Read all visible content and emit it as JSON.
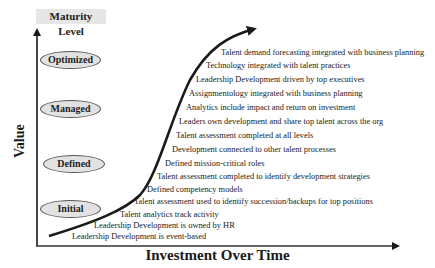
{
  "diagram": {
    "y_axis_header": "Maturity Level",
    "y_axis_label": "Value",
    "x_axis_label": "Investment Over Time",
    "maturity_levels": [
      {
        "label": "Optimized"
      },
      {
        "label": "Managed"
      },
      {
        "label": "Defined"
      },
      {
        "label": "Initial"
      }
    ],
    "statements": [
      "Talent demand forecasting integrated with business planning",
      "Technology integrated with talent practices",
      "Leadership Development driven by top executives",
      "Assignmentology integrated with business planning",
      "Analytics include impact and return on investment",
      "Leaders own development and share top talent across the org",
      "Talent assessment completed at all levels",
      "Development connected to other talent processes",
      "Defined mission-critical roles",
      "Talent assessment completed to identify development strategies",
      "Defined competency models",
      "Talent assessment used to identify succession/backups for top positions",
      "Talent analytics track activity",
      "Leadership Development is owned by HR",
      "Leadership Development is event-based"
    ],
    "colors": {
      "ellipse_fill": "#e2e2e2",
      "header_fill": "#e6e6e6",
      "line": "#1a1a1a"
    }
  }
}
